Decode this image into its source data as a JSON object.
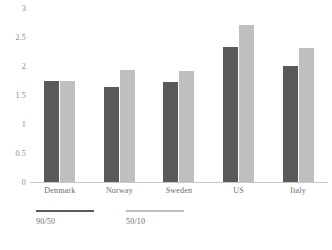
{
  "chart_data": {
    "type": "bar",
    "title": "",
    "subtitle": "",
    "xlabel": "",
    "ylabel": "",
    "ylim": [
      0,
      3
    ],
    "ytick_labels": [
      "3",
      "2.5",
      "2",
      "1.5",
      "1",
      "0.5",
      "0"
    ],
    "ytick_values": [
      3,
      2.5,
      2,
      1.5,
      1,
      0.5,
      0
    ],
    "grid": false,
    "legend_position": "bottom-left",
    "categories": [
      "Denmark",
      "Norway",
      "Sweden",
      "US",
      "Italy"
    ],
    "series": [
      {
        "name": "90/50",
        "color": "#595959",
        "values": [
          1.75,
          1.63,
          1.72,
          2.32,
          2.0
        ]
      },
      {
        "name": "50/10",
        "color": "#bfbfbf",
        "values": [
          1.75,
          1.93,
          1.92,
          2.7,
          2.31
        ]
      }
    ]
  },
  "legend": {
    "items": [
      {
        "label": "90/50",
        "color": "#595959"
      },
      {
        "label": "50/10",
        "color": "#bfbfbf"
      }
    ]
  },
  "source_note": "",
  "colors": {
    "series_dark": "#595959",
    "series_light": "#bfbfbf",
    "axis_line": "#c8c8c8",
    "tick_text": "#8a8a8a",
    "label_text": "#6b6b6b",
    "background": "#ffffff"
  }
}
